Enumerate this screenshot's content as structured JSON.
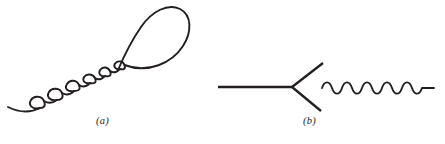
{
  "figure": {
    "background_color": "#ffffff",
    "stroke_color": "#231f20",
    "width": 445,
    "height": 144,
    "panels": [
      {
        "id": "a",
        "caption": "(a)",
        "description": "curled-spiral-with-large-teardrop-loop",
        "curl_count": 6,
        "has_large_loop": true
      },
      {
        "id": "b",
        "caption": "(b)",
        "description": "forked-line-vertex-with-wavy-line",
        "branch_count": 2,
        "wave_cycles": 7
      }
    ]
  },
  "panel_a": {
    "caption": "(a)",
    "tail_path": "M 8 107 C 18 112 30 113 40 108",
    "curls": [
      "M 40 108 C 32 110 28 105 31 100 C 34 95 42 96 44 101 C 46 106 44 108 40 108",
      "M 44 101 C 49 104 53 103 57 100 C 50 101 46 97 49 92 C 52 87 60 88 62 93 C 64 98 61 100 57 100",
      "M 62 93 C 67 96 71 94 74 91 C 68 92 64 89 67 84 C 70 79 77 80 79 85 C 81 90 78 91 74 91",
      "M 79 85 C 83 88 87 86 90 83 C 85 84 82 81 84 77 C 87 73 93 74 95 78 C 97 83 94 84 90 83",
      "M 95 78 C 99 81 102 79 105 76 C 101 77 98 74 100 70 C 103 66 108 67 110 71 C 112 76 109 77 105 76",
      "M 110 71 C 114 74 117 72 120 69 C 116 70 113 67 115 63.5 C 118 60 123 61 124.5 65 C 126 69 123.5 70 120 69"
    ],
    "loop_path": "M 118 70 C 124 56 132 40 141 27 C 152 11 168 3 180 9 C 192 15 192 32 183 46 C 172 63 148 74 124.5 65",
    "caption_position": {
      "x": 96,
      "y": 115
    }
  },
  "panel_b": {
    "caption": "(b)",
    "incoming_line": "M 218 87 L 293 87",
    "upper_branch": "M 292 87 L 323 63",
    "lower_branch": "M 292 87 L 321 111",
    "wavy_line": "M 322 88 C 324.5 80.5 329.5 80.5 332 88 C 334.5 95.5 339.5 95.5 342 88 C 344.5 80.5 349.5 80.5 352 88 C 354.5 95.5 359.5 95.5 362 88 C 364.5 80.5 369.5 80.5 372 88 C 374.5 95.5 379.5 95.5 382 88 C 384.5 80.5 389.5 80.5 392 88 C 394.5 95.5 399.5 95.5 402 88 C 404.5 80.5 409.5 80.5 412 88 C 414.5 95.5 419.5 95.5 422 88 L 434 88",
    "caption_position": {
      "x": 303,
      "y": 115
    }
  }
}
